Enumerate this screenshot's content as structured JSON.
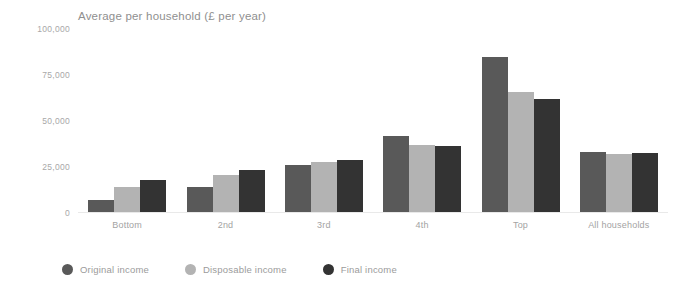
{
  "chart_data": {
    "type": "bar",
    "title": "Average per household (£ per year)",
    "xlabel": "",
    "ylabel": "",
    "ylim": [
      0,
      100000
    ],
    "yticks": [
      0,
      25000,
      50000,
      75000,
      100000
    ],
    "ytick_labels": [
      "0",
      "25,000",
      "50,000",
      "75,000",
      "100,000"
    ],
    "grid": false,
    "legend_position": "bottom-left",
    "categories": [
      "Bottom",
      "2nd",
      "3rd",
      "4th",
      "Top",
      "All households"
    ],
    "series": [
      {
        "name": "Original income",
        "color": "#595959",
        "values": [
          7000,
          14000,
          26000,
          42000,
          85000,
          33000
        ]
      },
      {
        "name": "Disposable income",
        "color": "#b3b3b3",
        "values": [
          14000,
          20500,
          27500,
          37000,
          66000,
          32000
        ]
      },
      {
        "name": "Final income",
        "color": "#333333",
        "values": [
          18000,
          23500,
          29000,
          36500,
          62000,
          32500
        ]
      }
    ]
  },
  "legend": {
    "items": [
      {
        "label": "Original income",
        "color": "#595959",
        "icon": "circle-marker-icon"
      },
      {
        "label": "Disposable income",
        "color": "#b3b3b3",
        "icon": "circle-marker-icon"
      },
      {
        "label": "Final income",
        "color": "#333333",
        "icon": "circle-marker-icon"
      }
    ]
  }
}
